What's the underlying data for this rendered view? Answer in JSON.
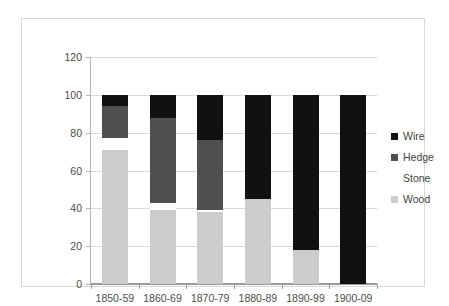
{
  "chart_data": {
    "type": "bar",
    "subtype": "stacked-bar-100pct",
    "title": "",
    "xlabel": "",
    "ylabel": "",
    "ylim": [
      0,
      120
    ],
    "yticks": [
      0,
      20,
      40,
      60,
      80,
      100,
      120
    ],
    "ytick_labels": [
      "0",
      "20",
      "40",
      "60",
      "80",
      "100",
      "120"
    ],
    "grid": "horizontal",
    "legend_position": "right",
    "categories": [
      "1850-59",
      "1860-69",
      "1870-79",
      "1880-89",
      "1890-99",
      "1900-09"
    ],
    "stack_order_bottom_to_top": [
      "Wood",
      "Stone",
      "Hedge",
      "Wire"
    ],
    "series": [
      {
        "name": "Wood",
        "color": "#cccccc",
        "values": [
          71,
          39,
          38,
          45,
          18,
          0
        ]
      },
      {
        "name": "Stone",
        "color": "#ffffff",
        "values": [
          6,
          4,
          1,
          0,
          0,
          0
        ]
      },
      {
        "name": "Hedge",
        "color": "#4f4f4f",
        "values": [
          17,
          45,
          37,
          0,
          0,
          0
        ]
      },
      {
        "name": "Wire",
        "color": "#111111",
        "values": [
          6,
          12,
          24,
          55,
          82,
          100
        ]
      }
    ]
  },
  "legend": {
    "items": [
      {
        "label": "Wire",
        "color": "#111111"
      },
      {
        "label": "Hedge",
        "color": "#4f4f4f"
      },
      {
        "label": "Stone",
        "color": "#ffffff"
      },
      {
        "label": "Wood",
        "color": "#cccccc"
      }
    ]
  },
  "colors": {
    "wire": "#111111",
    "hedge": "#4f4f4f",
    "stone": "#ffffff",
    "wood": "#cccccc",
    "gridline": "#d9d9d9",
    "axis": "#999999",
    "tick_text": "#4d4d4d",
    "frame_border": "#d8d8d8",
    "background": "#ffffff"
  }
}
